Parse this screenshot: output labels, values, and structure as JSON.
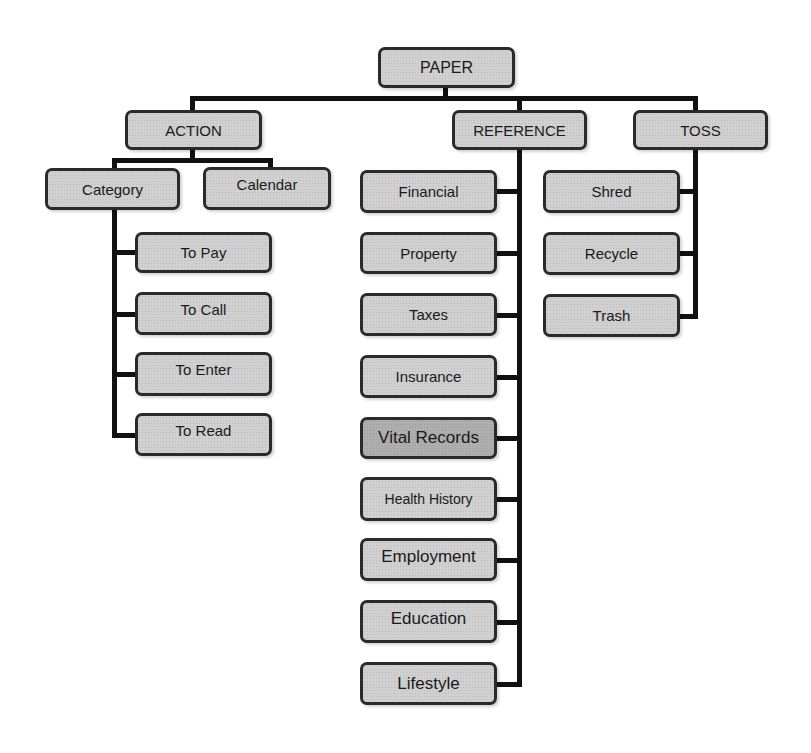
{
  "root": {
    "label": "PAPER"
  },
  "branches": {
    "action": {
      "label": "ACTION",
      "subs": [
        {
          "label": "Category"
        },
        {
          "label": "Calendar"
        }
      ],
      "children": [
        {
          "label": "To Pay"
        },
        {
          "label": "To Call"
        },
        {
          "label": "To Enter"
        },
        {
          "label": "To Read"
        }
      ]
    },
    "reference": {
      "label": "REFERENCE",
      "children": [
        {
          "label": "Financial"
        },
        {
          "label": "Property"
        },
        {
          "label": "Taxes"
        },
        {
          "label": "Insurance"
        },
        {
          "label": "Vital Records",
          "highlighted": true
        },
        {
          "label": "Health History"
        },
        {
          "label": "Employment"
        },
        {
          "label": "Education"
        },
        {
          "label": "Lifestyle"
        }
      ]
    },
    "toss": {
      "label": "TOSS",
      "children": [
        {
          "label": "Shred"
        },
        {
          "label": "Recycle"
        },
        {
          "label": "Trash"
        }
      ]
    }
  },
  "colors": {
    "node_fill": "#d0d0d0",
    "node_fill_highlight": "#aeaeae",
    "node_border": "#2a2a2a",
    "connector": "#111111",
    "background": "#ffffff"
  }
}
